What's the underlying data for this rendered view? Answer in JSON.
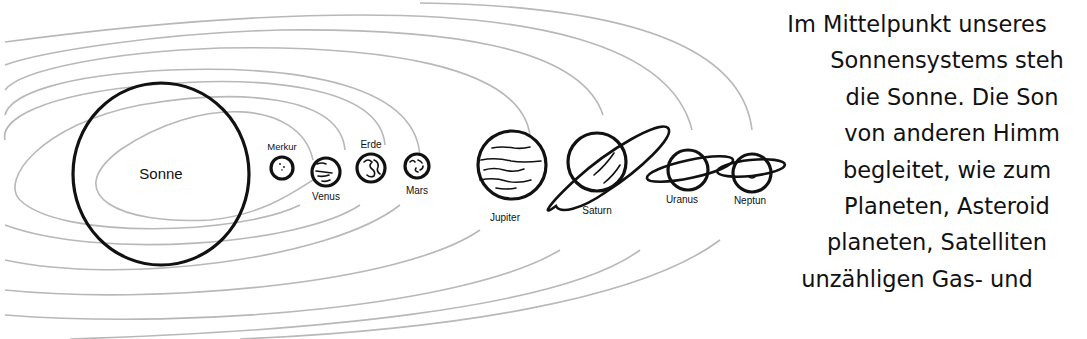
{
  "diagram": {
    "title": "Sonnensystem",
    "bodies": [
      {
        "name": "Sonne",
        "type": "star"
      },
      {
        "name": "Merkur",
        "type": "planet"
      },
      {
        "name": "Venus",
        "type": "planet"
      },
      {
        "name": "Erde",
        "type": "planet"
      },
      {
        "name": "Mars",
        "type": "planet"
      },
      {
        "name": "Jupiter",
        "type": "planet"
      },
      {
        "name": "Saturn",
        "type": "planet"
      },
      {
        "name": "Uranus",
        "type": "planet"
      },
      {
        "name": "Neptun",
        "type": "planet"
      }
    ]
  },
  "text": {
    "lines": [
      "Im Mittelpunkt unseres",
      "Sonnensystems steh",
      "die Sonne. Die Son",
      "von anderen Himm",
      "begleitet, wie zum",
      "Planeten, Asteroid",
      "planeten, Satelliten",
      "unzähligen Gas- und"
    ]
  }
}
